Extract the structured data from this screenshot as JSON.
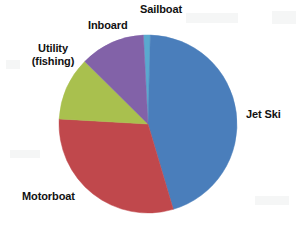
{
  "chart_data": {
    "type": "pie",
    "title": "",
    "subtitle": "",
    "xlabel": "",
    "ylabel": "",
    "legend_position": "none",
    "labels_position": "outside-callout",
    "grid": false,
    "start_angle_deg": -3,
    "direction": "clockwise",
    "center": {
      "cx": 148,
      "cy": 124,
      "r": 89
    },
    "categories": [
      "Sailboat",
      "Jet Ski",
      "Motorboat",
      "Utility (fishing)",
      "Inboard"
    ],
    "values": [
      1.5,
      45.0,
      30.5,
      11.5,
      11.5
    ],
    "colors": [
      "#5aa9cf",
      "#4a7ebb",
      "#c0484c",
      "#a9c04e",
      "#8262a8"
    ],
    "slices": [
      {
        "name": "Sailboat",
        "label": "Sailboat",
        "value": 1.5,
        "color": "#5aa9cf",
        "start_deg": -3.0,
        "end_deg": 1.5
      },
      {
        "name": "Jet Ski",
        "label": "Jet Ski",
        "value": 45.0,
        "color": "#4a7ebb",
        "start_deg": 1.5,
        "end_deg": 163.5
      },
      {
        "name": "Motorboat",
        "label": "Motorboat",
        "value": 30.5,
        "color": "#c0484c",
        "start_deg": 163.5,
        "end_deg": 273.3
      },
      {
        "name": "Utility (fishing)",
        "label_line_1": "Utility",
        "label_line_2": "(fishing)",
        "value": 11.5,
        "color": "#a9c04e",
        "start_deg": 273.3,
        "end_deg": 314.7
      },
      {
        "name": "Inboard",
        "label": "Inboard",
        "value": 11.5,
        "color": "#8262a8",
        "start_deg": 314.7,
        "end_deg": 357.0
      }
    ]
  },
  "labels": {
    "sailboat": "Sailboat",
    "inboard": "Inboard",
    "utility_line1": "Utility",
    "utility_line2": "(fishing)",
    "motorboat": "Motorboat",
    "jet_ski": "Jet Ski"
  },
  "style": {
    "background": "#ffffff",
    "text_color": "#111111"
  }
}
